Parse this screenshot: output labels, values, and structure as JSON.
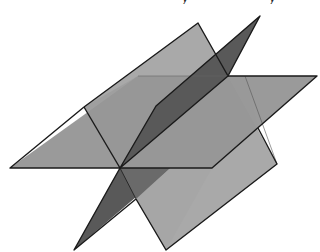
{
  "figure": {
    "caption_partial": "y y",
    "colors": {
      "background": "#ffffff",
      "light_plane": "#a9a9a9",
      "horizontal_plane": "#919191",
      "dark_plane": "#595959",
      "edge": "#1a1a1a"
    },
    "planes": [
      {
        "name": "tilted-light-plane",
        "points": [
          [
            84,
            107
          ],
          [
            198,
            23
          ],
          [
            277,
            164
          ],
          [
            166,
            250
          ]
        ]
      },
      {
        "name": "horizontal-plane",
        "points": [
          [
            10,
            168
          ],
          [
            138,
            76
          ],
          [
            317,
            76
          ],
          [
            212,
            168
          ]
        ]
      },
      {
        "name": "dark-vertical-plane-upper",
        "points": [
          [
            120,
            168
          ],
          [
            156,
            106
          ],
          [
            260,
            16
          ],
          [
            228,
            76
          ]
        ]
      },
      {
        "name": "dark-vertical-plane-lower",
        "points": [
          [
            120,
            168
          ],
          [
            170,
            168
          ],
          [
            74,
            250
          ]
        ]
      }
    ],
    "intersection_point": [
      120,
      168
    ]
  }
}
